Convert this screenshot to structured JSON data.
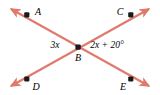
{
  "figure": {
    "kind": "geometry-diagram",
    "background_color": "#ffffff",
    "line_color": "#e0796b",
    "point_color": "#1a1a1a",
    "text_color": "#000000",
    "width": 160,
    "height": 95,
    "points": [
      {
        "id": "A",
        "label": "A",
        "dot_x": 27,
        "dot_y": 15,
        "label_x": 38,
        "label_y": 12
      },
      {
        "id": "C",
        "label": "C",
        "dot_x": 131,
        "dot_y": 15,
        "label_x": 120,
        "label_y": 12
      },
      {
        "id": "B",
        "label": "B",
        "dot_x": 78,
        "dot_y": 47,
        "label_x": 78,
        "label_y": 58
      },
      {
        "id": "D",
        "label": "D",
        "dot_x": 27,
        "dot_y": 79,
        "label_x": 36,
        "label_y": 87
      },
      {
        "id": "E",
        "label": "E",
        "dot_x": 131,
        "dot_y": 79,
        "label_x": 123,
        "label_y": 87
      }
    ],
    "lines": [
      {
        "id": "line-A-E",
        "from": "A",
        "through": "B",
        "to": "E",
        "x1": 9,
        "y1": 7,
        "x2": 151,
        "y2": 88,
        "arrow_start": true,
        "arrow_end": true
      },
      {
        "id": "line-D-C",
        "from": "D",
        "through": "B",
        "to": "C",
        "x1": 9,
        "y1": 88,
        "x2": 151,
        "y2": 7,
        "arrow_start": true,
        "arrow_end": true
      }
    ],
    "angle_labels": [
      {
        "id": "angle-ABD",
        "text": "3x",
        "x": 55,
        "y": 46
      },
      {
        "id": "angle-CBE",
        "expr": "2x + 20",
        "unit": "°",
        "text": "2x + 20°",
        "x": 107,
        "y": 46
      }
    ]
  }
}
